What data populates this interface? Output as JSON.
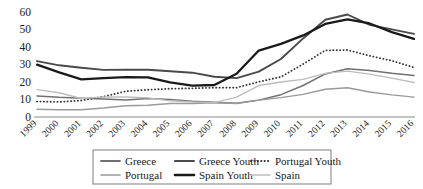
{
  "chart_data": {
    "type": "line",
    "title": "",
    "subtitle": "",
    "xlabel": "",
    "ylabel": "",
    "ylim": [
      0,
      60
    ],
    "y_ticks": [
      0,
      10,
      20,
      30,
      40,
      50,
      60
    ],
    "grid": false,
    "legend_position": "bottom",
    "x_label_rotation": -45,
    "categories": [
      "1999",
      "2000",
      "2001",
      "2002",
      "2003",
      "2004",
      "2005",
      "2006",
      "2007",
      "2008",
      "2009",
      "2010",
      "2011",
      "2012",
      "2013",
      "2014",
      "2015",
      "2016"
    ],
    "series": [
      {
        "name": "Greece",
        "color": "#707070",
        "width": 1.5,
        "dash": "none",
        "values": [
          12.0,
          11.2,
          10.7,
          10.3,
          9.7,
          10.5,
          9.9,
          8.9,
          8.4,
          7.8,
          9.6,
          12.7,
          17.9,
          24.5,
          27.5,
          26.5,
          24.9,
          23.6
        ]
      },
      {
        "name": "Greece Youth",
        "color": "#4a4a4a",
        "width": 1.9,
        "dash": "none",
        "values": [
          31.8,
          29.4,
          28.0,
          26.8,
          26.9,
          26.9,
          26.0,
          25.2,
          22.9,
          22.1,
          25.8,
          33.0,
          44.7,
          55.3,
          58.3,
          52.4,
          49.8,
          47.3
        ]
      },
      {
        "name": "Portugal Youth",
        "color": "#333333",
        "width": 1.8,
        "dash": "dotted",
        "values": [
          8.8,
          8.6,
          9.4,
          11.6,
          14.6,
          15.5,
          16.1,
          16.3,
          16.7,
          16.7,
          20.0,
          22.8,
          30.1,
          37.9,
          38.1,
          34.8,
          32.0,
          28.2
        ]
      },
      {
        "name": "Portugal",
        "color": "#9a9a9a",
        "width": 1.4,
        "dash": "none",
        "values": [
          4.4,
          4.1,
          4.1,
          5.1,
          6.4,
          6.7,
          7.7,
          7.7,
          8.1,
          7.7,
          9.6,
          11.0,
          12.9,
          15.8,
          16.6,
          14.2,
          12.6,
          11.3
        ]
      },
      {
        "name": "Spain Youth",
        "color": "#1a1a1a",
        "width": 2.3,
        "dash": "none",
        "values": [
          29.8,
          25.4,
          21.4,
          22.1,
          22.7,
          22.5,
          19.7,
          17.9,
          18.2,
          24.6,
          37.8,
          41.6,
          46.4,
          52.9,
          55.5,
          53.2,
          48.3,
          44.4
        ]
      },
      {
        "name": "Spain",
        "color": "#bdbdbd",
        "width": 1.4,
        "dash": "none",
        "values": [
          15.6,
          13.8,
          10.5,
          11.4,
          11.4,
          10.9,
          9.2,
          8.5,
          8.2,
          11.3,
          17.9,
          19.9,
          21.4,
          24.8,
          26.1,
          24.4,
          22.1,
          19.6
        ]
      }
    ]
  },
  "axes": {
    "y_tick_labels": [
      "0",
      "10",
      "20",
      "30",
      "40",
      "50",
      "60"
    ],
    "x_tick_labels": [
      "1999",
      "2000",
      "2001",
      "2002",
      "2003",
      "2004",
      "2005",
      "2006",
      "2007",
      "2008",
      "2009",
      "2010",
      "2011",
      "2012",
      "2013",
      "2014",
      "2015",
      "2016"
    ]
  },
  "legend": {
    "entries": [
      {
        "label": "Greece",
        "color": "#707070",
        "width": 1.8,
        "dash": "none"
      },
      {
        "label": "Greece Youth",
        "color": "#4a4a4a",
        "width": 2.0,
        "dash": "none"
      },
      {
        "label": "Portugal Youth",
        "color": "#333333",
        "width": 2.0,
        "dash": "dotted"
      },
      {
        "label": "Portugal",
        "color": "#9a9a9a",
        "width": 1.6,
        "dash": "none"
      },
      {
        "label": "Spain Youth",
        "color": "#1a1a1a",
        "width": 2.6,
        "dash": "none"
      },
      {
        "label": "Spain",
        "color": "#bdbdbd",
        "width": 1.6,
        "dash": "none"
      }
    ]
  },
  "colors": {
    "axis": "#8a8a8a",
    "text": "#1a1a1a",
    "legend_border": "#6f6f6f",
    "background": "#ffffff"
  }
}
